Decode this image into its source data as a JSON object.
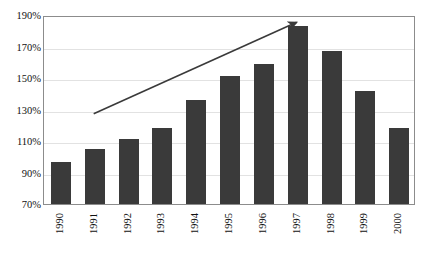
{
  "chart_data": {
    "type": "bar",
    "title": "",
    "subtitle": "",
    "xlabel": "",
    "ylabel": "",
    "categories": [
      "1990",
      "1991",
      "1992",
      "1993",
      "1994",
      "1995",
      "1996",
      "1997",
      "1998",
      "1999",
      "2000"
    ],
    "values": [
      97,
      105,
      111,
      118,
      136,
      151,
      159,
      183,
      167,
      142,
      118
    ],
    "value_format": "percent",
    "ylim": [
      70,
      190
    ],
    "ytick_values": [
      70,
      90,
      110,
      130,
      150,
      170,
      190
    ],
    "ytick_labels": [
      "70%",
      "90%",
      "110%",
      "130%",
      "150%",
      "170%",
      "190%"
    ],
    "grid": "horizontal",
    "legend": "none",
    "bar_color": "#3a3a3a",
    "grid_color": "#e2e2e2",
    "frame_color": "#8c8c8c",
    "annotations": [
      {
        "name": "upward-trend-arrow",
        "type": "arrow",
        "color": "#3a3a3a",
        "from_category": "1991",
        "to_category": "1997",
        "from_value": 128,
        "to_value": 186
      }
    ]
  }
}
